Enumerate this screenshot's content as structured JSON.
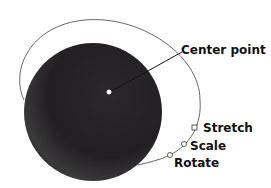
{
  "diagram": {
    "labels": {
      "center_point": "Center point",
      "stretch": "Stretch",
      "scale": "Scale",
      "rotate": "Rotate"
    },
    "colors": {
      "sphere": "#1e1c1e",
      "outline": "#555555",
      "text": "#111111"
    }
  }
}
